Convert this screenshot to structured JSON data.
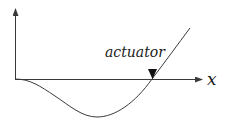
{
  "diagram": {
    "axis_label_x": "x",
    "actuator_label": "actuator",
    "colors": {
      "line": "#3a3a3a",
      "text": "#1a1a1a",
      "background": "#ffffff"
    },
    "elements": {
      "vertical_axis": "arrow pointing up from origin",
      "horizontal_axis": "arrow pointing right labeled x",
      "curve": "deflection curve dipping below axis then rising through actuator point",
      "actuator_marker": "downward-pointing filled triangle on x-axis"
    }
  }
}
